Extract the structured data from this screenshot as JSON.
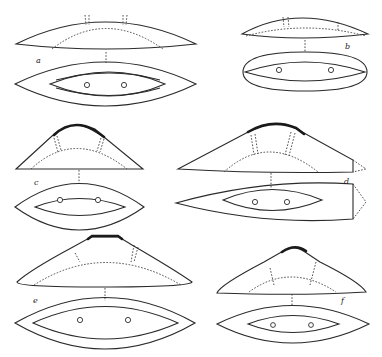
{
  "figure": {
    "panels": [
      {
        "id": "a",
        "label": "a",
        "description": "shallow convex cover above oval base with inner lens and two holes"
      },
      {
        "id": "b",
        "label": "b",
        "description": "small shallow cover above oval base with inner lens and two holes"
      },
      {
        "id": "c",
        "label": "c",
        "description": "peaked cover with thick ridge above lens-shaped base with two holes"
      },
      {
        "id": "d",
        "label": "d",
        "description": "wide asymmetric peaked cover with dotted extension above elongated base"
      },
      {
        "id": "e",
        "label": "e",
        "description": "wide peaked cover with flat thick ridge above lens-shaped base with two holes"
      },
      {
        "id": "f",
        "label": "f",
        "description": "peaked cover with thick ridge above lens-shaped base with two holes"
      }
    ],
    "caption": ""
  }
}
